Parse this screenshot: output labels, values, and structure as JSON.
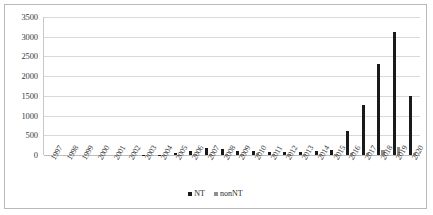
{
  "chart_data": {
    "type": "bar",
    "title": "",
    "xlabel": "",
    "ylabel": "",
    "ylim": [
      0,
      3500
    ],
    "ytick_step": 500,
    "grid": true,
    "legend_position": "bottom",
    "yticks": [
      "3500",
      "3000",
      "2500",
      "2000",
      "1500",
      "1000",
      "500",
      "0"
    ],
    "categories": [
      "1997",
      "1998",
      "1999",
      "2000",
      "2001",
      "2002",
      "2003",
      "2004",
      "2005",
      "2006",
      "2007",
      "2008",
      "2009",
      "2010",
      "2011",
      "2012",
      "2013",
      "2014",
      "2015",
      "2016",
      "2017",
      "2018",
      "2019",
      "2020"
    ],
    "series": [
      {
        "name": "NT",
        "color": "#1a1a1a",
        "values": [
          0,
          0,
          0,
          0,
          0,
          0,
          5,
          10,
          40,
          95,
          170,
          165,
          95,
          100,
          85,
          80,
          75,
          90,
          135,
          620,
          1270,
          2300,
          3120,
          1490
        ]
      },
      {
        "name": "nonNT",
        "color": "#8f8f8f",
        "values": [
          0,
          0,
          0,
          0,
          0,
          0,
          0,
          5,
          10,
          20,
          25,
          25,
          15,
          55,
          20,
          25,
          20,
          25,
          35,
          45,
          60,
          115,
          210,
          55
        ]
      }
    ],
    "legend": [
      "NT",
      "nonNT"
    ]
  }
}
